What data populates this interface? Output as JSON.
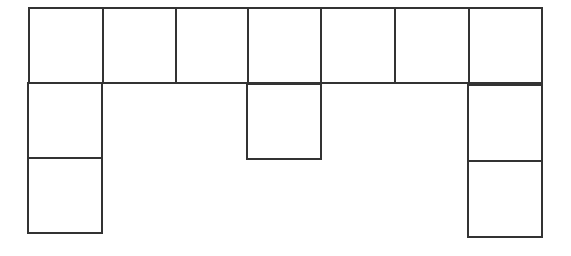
{
  "diagram": {
    "type": "grid-net",
    "stroke_color": "#333333",
    "fill_color": "#ffffff",
    "background": "#ffffff",
    "top_row": {
      "count": 7,
      "x_edges": [
        29,
        103,
        176,
        248,
        321,
        395,
        469,
        542
      ],
      "y_top": 8,
      "y_bottom": 83
    },
    "columns_below": [
      {
        "column_index": 0,
        "squares_below": 2,
        "x": [
          28,
          102
        ],
        "y_edges": [
          83,
          158,
          233
        ]
      },
      {
        "column_index": 3,
        "squares_below": 1,
        "x": [
          247,
          321
        ],
        "y_edges": [
          84,
          159
        ]
      },
      {
        "column_index": 6,
        "squares_below": 2,
        "x": [
          468,
          542
        ],
        "y_edges": [
          85,
          161,
          237
        ]
      }
    ],
    "total_squares": 12
  }
}
